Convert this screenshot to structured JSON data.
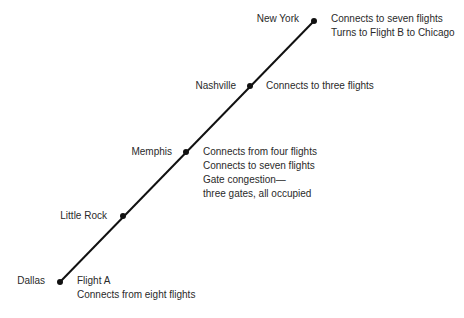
{
  "diagram": {
    "type": "route-line",
    "line_color": "#111111",
    "stops": [
      {
        "city": "New York",
        "details": [
          "Connects to seven flights",
          "Turns to Flight B to Chicago"
        ]
      },
      {
        "city": "Nashville",
        "details": [
          "Connects to three flights"
        ]
      },
      {
        "city": "Memphis",
        "details": [
          "Connects from four flights",
          "Connects to seven flights",
          "Gate congestion—",
          "three gates, all occupied"
        ]
      },
      {
        "city": "Little Rock",
        "details": []
      },
      {
        "city": "Dallas",
        "details": [
          "Flight A",
          "Connects from eight flights"
        ]
      }
    ]
  }
}
